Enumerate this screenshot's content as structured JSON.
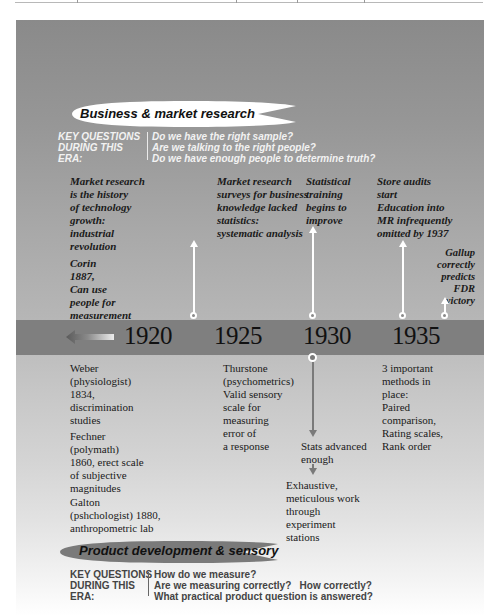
{
  "header_era": {
    "title": "Business & market research",
    "key_questions_label": "KEY QUESTIONS\nDURING THIS\nERA:",
    "questions": [
      "Do we have the right sample?",
      "Are we talking to the right people?",
      "Do we have enough people to determine truth?"
    ]
  },
  "timeline": {
    "years": [
      "1920",
      "1925",
      "1930",
      "1935"
    ],
    "back_arrow_icon": "left-arrow-icon"
  },
  "above_events": [
    {
      "text": "Market research\nis the history\nof technology\ngrowth:\nindustrial\nrevolution"
    },
    {
      "text": "Corin\n1887,\nCan use\npeople for\nmeasurement"
    },
    {
      "text": "Market research\nsurveys for business\nknowledge lacked\nstatistics:\nsystematic analysis"
    },
    {
      "text": "Statistical\ntraining\nbegins to\nimprove"
    },
    {
      "text": "Store audits\nstart"
    },
    {
      "text": "Education into\nMR infrequently\nomitted by 1937"
    },
    {
      "text": "Gallup\ncorrectly\npredicts\nFDR\nvictory"
    }
  ],
  "below_events": [
    {
      "text": "Weber\n(physiologist)\n1834,\ndiscrimination\nstudies"
    },
    {
      "text": "Fechner\n(polymath)\n1860, erect scale\nof subjective\nmagnitudes"
    },
    {
      "text": "Galton\n(pshchologist) 1880,\nanthropometric lab"
    },
    {
      "text": "Thurstone\n(psychometrics)\nValid sensory\nscale for\nmeasuring\nerror of\na response"
    },
    {
      "text": "Stats advanced\nenough"
    },
    {
      "text": "Exhaustive,\nmeticulous work\nthrough\nexperiment\nstations"
    },
    {
      "text": "3 important\nmethods in\nplace:\nPaired\ncomparison,\nRating scales,\nRank order"
    }
  ],
  "footer_era": {
    "title": "Product development & sensory",
    "key_questions_label": "KEY QUESTIONS\nDURING THIS\nERA:",
    "questions": [
      "How do we measure?",
      "Are we measuring correctly?   How correctly?",
      "What practical product question is answered?"
    ]
  },
  "colors": {
    "band": "#7f7f7f",
    "panel_top": "#8a8a8a",
    "panel_bottom": "#ffffff",
    "pill_light": "#ffffff",
    "pill_dark": "#7a7a7a"
  }
}
